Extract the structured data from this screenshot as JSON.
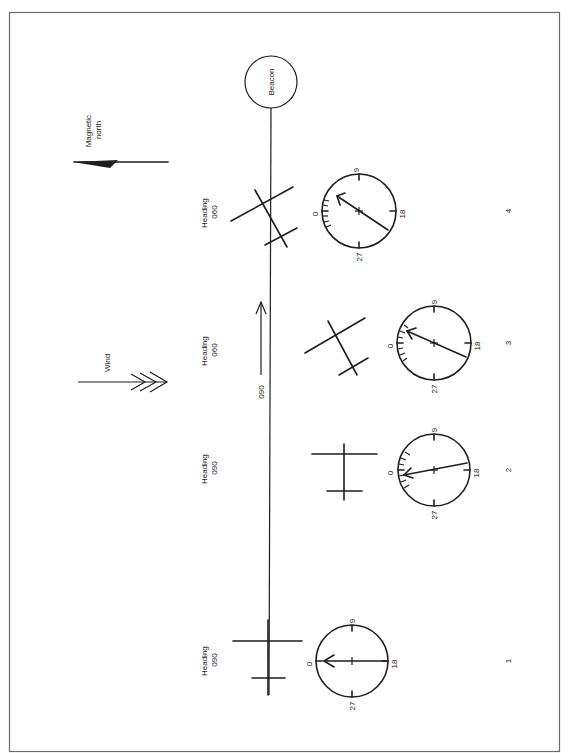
{
  "figure": {
    "border_color": "#6a6a6a",
    "ink_color": "#1e1e1e",
    "background": "#ffffff"
  },
  "legend": {
    "magnetic_north_label_line1": "Magnetic",
    "magnetic_north_label_line2": "north",
    "wind_label": "Wind"
  },
  "beacon": {
    "label": "Beacon"
  },
  "track": {
    "label": "090"
  },
  "positions": [
    {
      "number": "1",
      "heading_label": "Heading",
      "heading_value": "090",
      "compass": {
        "north": "0",
        "east": "9",
        "south": "18",
        "west": "27",
        "needle_relative_bearing": 0
      }
    },
    {
      "number": "2",
      "heading_label": "Heading",
      "heading_value": "090",
      "compass": {
        "north": "0",
        "east": "9",
        "south": "18",
        "west": "27",
        "needle_relative_bearing": 350
      }
    },
    {
      "number": "3",
      "heading_label": "Heading",
      "heading_value": "060",
      "compass": {
        "north": "0",
        "east": "9",
        "south": "18",
        "west": "27",
        "needle_relative_bearing": 24
      }
    },
    {
      "number": "4",
      "heading_label": "Heading",
      "heading_value": "060",
      "compass": {
        "north": "0",
        "east": "9",
        "south": "18",
        "west": "27",
        "needle_relative_bearing": 34
      }
    }
  ]
}
